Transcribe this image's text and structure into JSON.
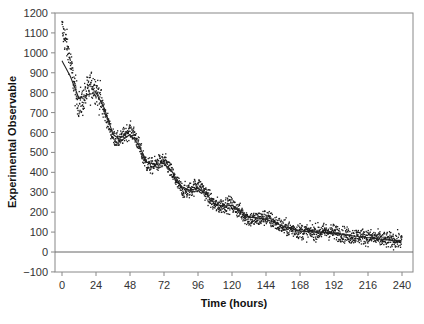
{
  "chart_data": {
    "type": "scatter",
    "title": "",
    "xlabel": "Time (hours)",
    "ylabel": "Experimental Observable",
    "xlim": [
      -6,
      250
    ],
    "ylim": [
      -100,
      1200
    ],
    "x_ticks": [
      0,
      24,
      48,
      72,
      96,
      120,
      144,
      168,
      192,
      216,
      240
    ],
    "y_ticks": [
      -100,
      0,
      100,
      200,
      300,
      400,
      500,
      600,
      700,
      800,
      900,
      1000,
      1100,
      1200
    ],
    "grid": false,
    "legend": null,
    "reference_line": {
      "y": 0
    },
    "series": [
      {
        "name": "Observed data (scatter)",
        "style": "points",
        "x": [
          0,
          3,
          6,
          9,
          12,
          15,
          18,
          21,
          24,
          27,
          30,
          33,
          36,
          39,
          42,
          45,
          48,
          51,
          54,
          57,
          60,
          63,
          66,
          69,
          72,
          75,
          78,
          81,
          84,
          87,
          90,
          93,
          96,
          99,
          102,
          105,
          108,
          111,
          114,
          117,
          120,
          126,
          132,
          138,
          144,
          150,
          156,
          162,
          168,
          174,
          180,
          186,
          192,
          198,
          204,
          210,
          216,
          222,
          228,
          234,
          240
        ],
        "values": [
          1120,
          1050,
          950,
          820,
          740,
          760,
          810,
          840,
          820,
          770,
          700,
          640,
          580,
          560,
          570,
          600,
          610,
          590,
          540,
          480,
          440,
          430,
          440,
          450,
          455,
          430,
          390,
          350,
          320,
          305,
          310,
          325,
          335,
          320,
          290,
          260,
          235,
          230,
          235,
          240,
          235,
          200,
          165,
          165,
          175,
          150,
          125,
          115,
          105,
          100,
          100,
          105,
          100,
          90,
          80,
          80,
          75,
          70,
          60,
          60,
          55
        ]
      },
      {
        "name": "Model fit (line)",
        "style": "line",
        "x": [
          0,
          6,
          12,
          18,
          24,
          30,
          36,
          42,
          48,
          54,
          60,
          66,
          72,
          78,
          84,
          90,
          96,
          102,
          108,
          114,
          120,
          132,
          144,
          156,
          168,
          180,
          192,
          204,
          216,
          228,
          240
        ],
        "values": [
          960,
          880,
          770,
          790,
          800,
          720,
          590,
          560,
          590,
          540,
          450,
          440,
          445,
          400,
          330,
          310,
          320,
          290,
          240,
          230,
          235,
          175,
          165,
          130,
          105,
          100,
          95,
          82,
          72,
          62,
          55
        ]
      }
    ]
  }
}
